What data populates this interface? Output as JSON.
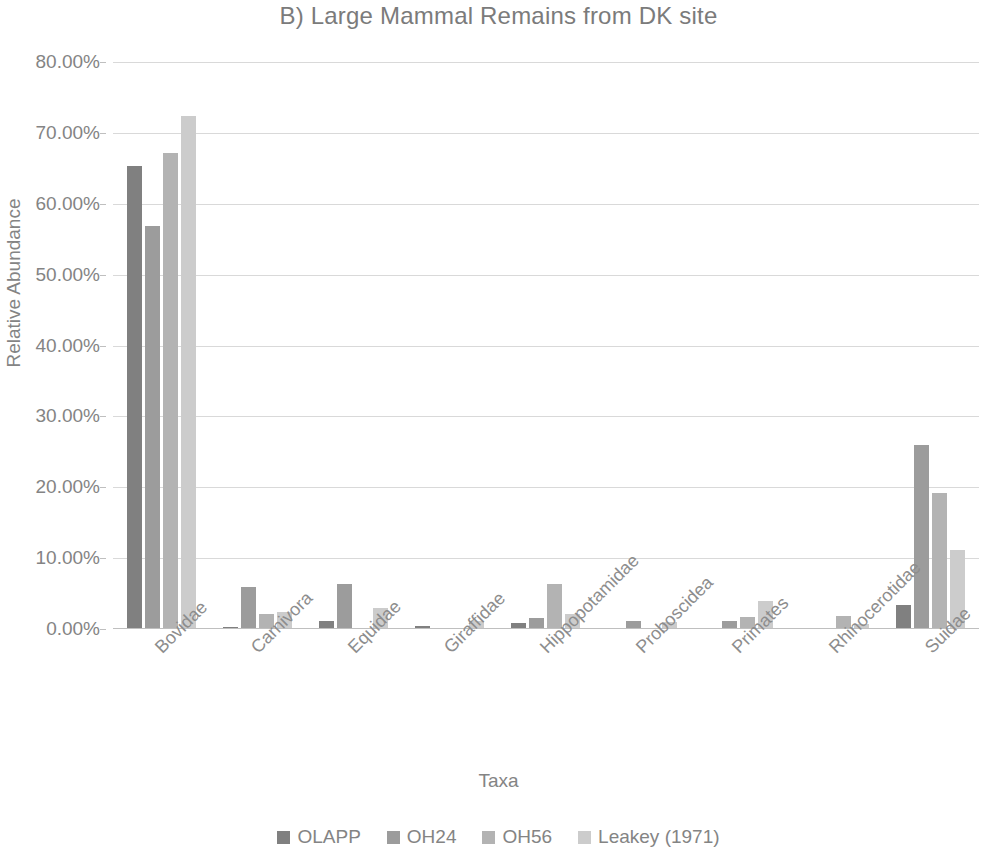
{
  "chart_data": {
    "type": "bar",
    "title": "B) Large Mammal Remains from DK site",
    "xlabel": "Taxa",
    "ylabel": "Relative Abundance",
    "ylim": [
      0,
      80
    ],
    "ytick_labels": [
      "80.00%",
      "70.00%",
      "60.00%",
      "50.00%",
      "40.00%",
      "30.00%",
      "20.00%",
      "10.00%",
      "0.00%"
    ],
    "ytick_values": [
      80,
      70,
      60,
      50,
      40,
      30,
      20,
      10,
      0
    ],
    "grid": true,
    "legend_position": "bottom",
    "categories": [
      "Bovidae",
      "Carnivora",
      "Equidae",
      "Giraffidae",
      "Hippopotamidae",
      "Proboscidea",
      "Primates",
      "Rhinocerotidae",
      "Suidae"
    ],
    "series": [
      {
        "name": "OLAPP",
        "color": "#808080",
        "values": [
          65.3,
          0.3,
          1.2,
          0.4,
          0.9,
          0.2,
          0.15,
          0.15,
          3.4
        ]
      },
      {
        "name": "OH24",
        "color": "#9c9c9c",
        "values": [
          56.8,
          5.9,
          6.3,
          0.0,
          1.6,
          1.1,
          1.1,
          0.0,
          25.9
        ]
      },
      {
        "name": "OH56",
        "color": "#b3b3b3",
        "values": [
          67.2,
          2.1,
          0.0,
          0.0,
          6.3,
          0.0,
          1.7,
          1.9,
          19.2
        ]
      },
      {
        "name": "Leakey (1971)",
        "color": "#cccccc",
        "values": [
          72.4,
          2.4,
          2.9,
          1.2,
          2.1,
          1.0,
          4.0,
          0.75,
          11.2
        ]
      }
    ]
  }
}
